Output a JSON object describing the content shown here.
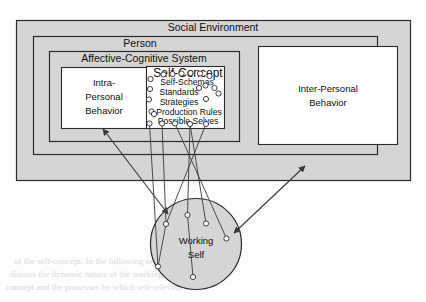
{
  "diagram": {
    "boxes": {
      "social_environment": {
        "label": "Social Environment"
      },
      "person": {
        "label": "Person"
      },
      "affective_cognitive_system": {
        "label": "Affective-Cognitive System"
      },
      "intra_personal_behavior": {
        "label": "Intra-Personal Behavior",
        "line1": "Intra-",
        "line2": "Personal",
        "line3": "Behavior"
      },
      "inter_personal_behavior": {
        "label": "Inter-Personal Behavior",
        "line1": "Inter-Personal",
        "line2": "Behavior"
      },
      "self_concept": {
        "label": "Self-Concept"
      }
    },
    "self_concept_items": [
      "Self-Schemas",
      "Standards",
      "Strategies",
      "Production Rules",
      "Possible Selves"
    ],
    "working_self": {
      "line1": "Working",
      "line2": "Self"
    },
    "colors": {
      "shade": "#d5d5d5",
      "white": "#ffffff",
      "stroke": "#2b2b2b",
      "text": "#101010",
      "node_fill": "#ffffff"
    },
    "self_concept_nodes": [
      {
        "cx": 150.5,
        "cy": 79.0
      },
      {
        "cx": 163.5,
        "cy": 74.5
      },
      {
        "cx": 172.5,
        "cy": 74.0
      },
      {
        "cx": 181.5,
        "cy": 73.5
      },
      {
        "cx": 190.5,
        "cy": 73.0
      },
      {
        "cx": 200.0,
        "cy": 73.5
      },
      {
        "cx": 209.5,
        "cy": 76.0
      },
      {
        "cx": 205.5,
        "cy": 85.5
      },
      {
        "cx": 214.5,
        "cy": 88.0
      },
      {
        "cx": 218.5,
        "cy": 93.5
      },
      {
        "cx": 150.0,
        "cy": 89.0
      },
      {
        "cx": 149.0,
        "cy": 99.5
      },
      {
        "cx": 199.0,
        "cy": 88.0
      },
      {
        "cx": 206.0,
        "cy": 99.0
      },
      {
        "cx": 151.5,
        "cy": 111.5
      },
      {
        "cx": 149.5,
        "cy": 123.5
      },
      {
        "cx": 162.0,
        "cy": 123.5
      },
      {
        "cx": 175.0,
        "cy": 123.5
      },
      {
        "cx": 190.0,
        "cy": 124.0
      },
      {
        "cx": 206.0,
        "cy": 124.0
      },
      {
        "cx": 154.0,
        "cy": 114.0
      }
    ],
    "working_self_nodes": [
      {
        "cx": 166.0,
        "cy": 224.0
      },
      {
        "cx": 187.5,
        "cy": 215.0
      },
      {
        "cx": 206.0,
        "cy": 223.5
      },
      {
        "cx": 226.5,
        "cy": 238.5
      },
      {
        "cx": 158.0,
        "cy": 266.5
      },
      {
        "cx": 193.0,
        "cy": 277.0
      }
    ],
    "links": [
      {
        "from": 0,
        "to": 0
      },
      {
        "from": 1,
        "to": 1
      },
      {
        "from": 2,
        "to": 4
      },
      {
        "from": 3,
        "to": 2
      },
      {
        "from": 4,
        "to": 3
      },
      {
        "from": 5,
        "to": 5
      }
    ]
  },
  "background_text": {
    "lines": [
      "of the self-concept. In the following sections we",
      "discuss the dynamic nature of the working self-",
      "concept and the processes by which self-relevant"
    ]
  }
}
